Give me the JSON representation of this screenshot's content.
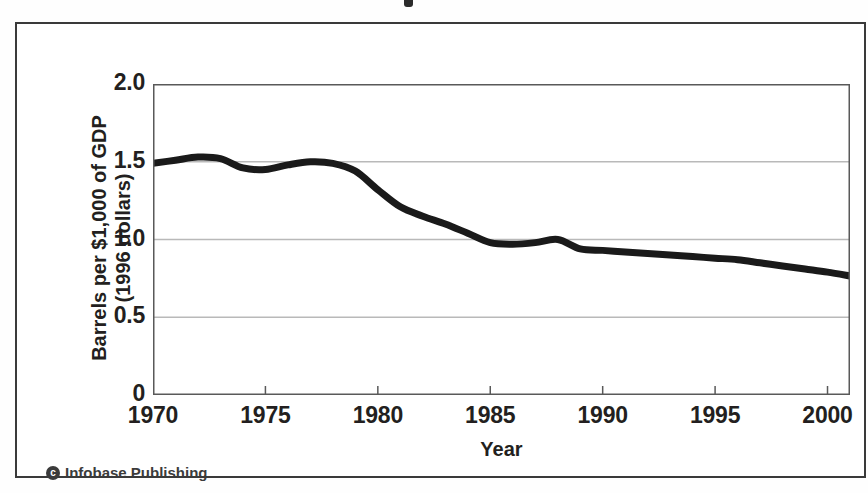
{
  "figure": {
    "credit": "Infobase Publishing",
    "credit_mark": "c"
  },
  "chart_data": {
    "type": "line",
    "title": "",
    "xlabel": "Year",
    "ylabel": "Barrels per $1,000 of GDP (1996 dollars)",
    "ylabel_line1": "Barrels per $1,000 of GDP",
    "ylabel_line2": "(1996 dollars)",
    "xlim": [
      1970,
      2001
    ],
    "ylim": [
      0,
      2.0
    ],
    "yticks": [
      0,
      0.5,
      1.0,
      1.5,
      2.0
    ],
    "ytick_labels": [
      "0",
      "0.5",
      "1.0",
      "1.5",
      "2.0"
    ],
    "xticks": [
      1970,
      1975,
      1980,
      1985,
      1990,
      1995,
      2000
    ],
    "xtick_labels": [
      "1970",
      "1975",
      "1980",
      "1985",
      "1990",
      "1995",
      "2000"
    ],
    "grid": "horizontal",
    "legend": "none",
    "line_color": "#1a1a1a",
    "line_width": 7,
    "x": [
      1970,
      1971,
      1972,
      1973,
      1974,
      1975,
      1976,
      1977,
      1978,
      1979,
      1980,
      1981,
      1982,
      1983,
      1984,
      1985,
      1986,
      1987,
      1988,
      1989,
      1990,
      1991,
      1992,
      1993,
      1994,
      1995,
      1996,
      1997,
      1998,
      1999,
      2000,
      2001
    ],
    "values": [
      1.49,
      1.51,
      1.53,
      1.52,
      1.46,
      1.45,
      1.48,
      1.5,
      1.49,
      1.44,
      1.32,
      1.21,
      1.15,
      1.1,
      1.04,
      0.98,
      0.97,
      0.98,
      1.0,
      0.94,
      0.93,
      0.92,
      0.91,
      0.9,
      0.89,
      0.88,
      0.87,
      0.85,
      0.83,
      0.81,
      0.79,
      0.765
    ],
    "series_name": "Energy intensity"
  }
}
